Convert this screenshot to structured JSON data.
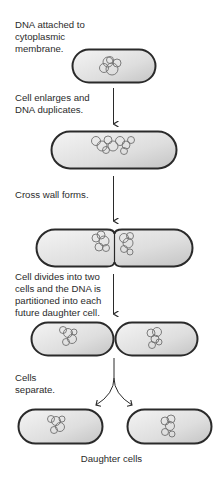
{
  "steps": [
    {
      "lines": [
        "DNA attached to",
        "cytoplasmic",
        "membrane."
      ]
    },
    {
      "lines": [
        "Cell enlarges and",
        "DNA duplicates."
      ]
    },
    {
      "lines": [
        "Cross wall forms."
      ]
    },
    {
      "lines": [
        "Cell divides into two",
        "cells and the DNA is",
        "partitioned into each",
        "future daughter cell."
      ]
    },
    {
      "lines": [
        "Cells",
        "separate."
      ]
    }
  ],
  "caption": "Daughter cells",
  "colors": {
    "cell_outline": "#2a2a2a",
    "cell_fill_light": "#f2f2f2",
    "cell_fill_dark": "#c8c8c8",
    "dna_strand": "#6b6b6b",
    "arrow": "#2a2a2a"
  }
}
